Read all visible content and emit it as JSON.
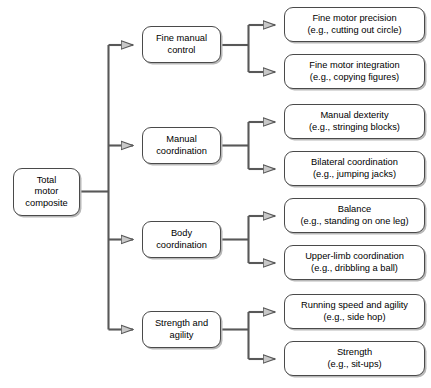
{
  "diagram": {
    "root": {
      "id": "total-motor-composite",
      "label": "Total\nmotor\ncomposite"
    },
    "subtests": [
      {
        "id": "fine-manual-control",
        "label": "Fine manual\ncontrol",
        "items": [
          {
            "id": "fine-motor-precision",
            "label": "Fine motor precision\n(e.g., cutting out circle)"
          },
          {
            "id": "fine-motor-integration",
            "label": "Fine motor integration\n(e.g., copying figures)"
          }
        ]
      },
      {
        "id": "manual-coordination",
        "label": "Manual\ncoordination",
        "items": [
          {
            "id": "manual-dexterity",
            "label": "Manual dexterity\n(e.g., stringing blocks)"
          },
          {
            "id": "bilateral-coordination",
            "label": "Bilateral coordination\n(e.g., jumping jacks)"
          }
        ]
      },
      {
        "id": "body-coordination",
        "label": "Body\ncoordination",
        "items": [
          {
            "id": "balance",
            "label": "Balance\n(e.g., standing on one leg)"
          },
          {
            "id": "upper-limb-coordination",
            "label": "Upper-limb coordination\n(e.g., dribbling a ball)"
          }
        ]
      },
      {
        "id": "strength-and-agility",
        "label": "Strength and\nagility",
        "items": [
          {
            "id": "running-speed-and-agility",
            "label": "Running speed and agility\n(e.g., side hop)"
          },
          {
            "id": "strength",
            "label": "Strength\n(e.g., sit-ups)"
          }
        ]
      }
    ],
    "style": {
      "line_color": "#585858",
      "arrow_fill": "#c9c9c9",
      "box_border": "#4a4a4a",
      "box_fill": "#ffffff",
      "shadow_color": "#b8b8b8",
      "background": "#ffffff"
    }
  }
}
